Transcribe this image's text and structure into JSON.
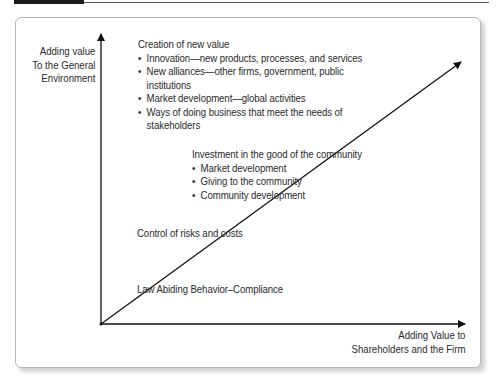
{
  "diagram": {
    "y_axis_label": [
      "Adding value",
      "To the General",
      "Environment"
    ],
    "x_axis_label": [
      "Adding Value to",
      "Shareholders and the Firm"
    ],
    "levels": [
      {
        "title": "Creation of new value",
        "bullets": [
          "Innovation—new products, processes, and services",
          "New alliances—other firms, government, public institutions",
          "Market development—global activities",
          "Ways of doing business that meet the needs of stakeholders"
        ]
      },
      {
        "title": "Investment in the good of the community",
        "bullets": [
          "Market development",
          "Giving to the community",
          "Community development"
        ]
      },
      {
        "title": "Control of risks and costs",
        "bullets": []
      },
      {
        "title": "Law Abiding Behavior–Compliance",
        "bullets": []
      }
    ]
  }
}
